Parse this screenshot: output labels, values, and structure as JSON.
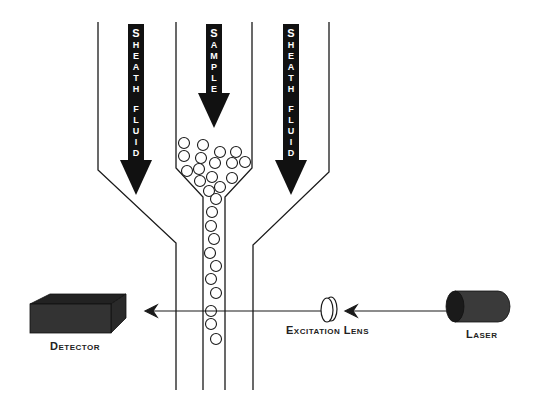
{
  "diagram": {
    "colors": {
      "background": "#ffffff",
      "line": "#1a1a1a",
      "arrow_fill": "#111111",
      "detector_front": "#333333",
      "detector_top": "#222222",
      "detector_side": "#2a2a2a",
      "laser_body": "#3a3a3a",
      "laser_end": "#1a1a1a",
      "arrow_text": "#ffffff"
    },
    "flow_arrows": [
      {
        "id": "sheath-left",
        "letters": [
          "S",
          "H",
          "E",
          "A",
          "T",
          "H",
          "",
          "F",
          "L",
          "U",
          "I",
          "D"
        ],
        "text": "SHEATH FLUID"
      },
      {
        "id": "sample",
        "letters": [
          "S",
          "A",
          "M",
          "P",
          "L",
          "E"
        ],
        "text": "SAMPLE"
      },
      {
        "id": "sheath-right",
        "letters": [
          "S",
          "H",
          "E",
          "A",
          "T",
          "H",
          "",
          "F",
          "L",
          "U",
          "I",
          "D"
        ],
        "text": "SHEATH FLUID"
      }
    ],
    "labels": {
      "detector": "Detector",
      "excitation_lens": "Excitation Lens",
      "laser": "Laser"
    },
    "particles": [
      [
        184,
        143
      ],
      [
        203,
        145
      ],
      [
        220,
        152
      ],
      [
        236,
        152
      ],
      [
        184,
        156
      ],
      [
        201,
        158
      ],
      [
        215,
        163
      ],
      [
        232,
        163
      ],
      [
        245,
        162
      ],
      [
        187,
        171
      ],
      [
        199,
        169
      ],
      [
        212,
        177
      ],
      [
        232,
        178
      ],
      [
        200,
        181
      ],
      [
        220,
        187
      ],
      [
        209,
        191
      ],
      [
        216,
        199
      ],
      [
        212,
        212
      ],
      [
        211,
        226
      ],
      [
        214,
        239
      ],
      [
        210,
        253
      ],
      [
        216,
        266
      ],
      [
        211,
        279
      ],
      [
        216,
        293
      ],
      [
        211,
        311
      ],
      [
        211,
        324
      ],
      [
        216,
        339
      ]
    ]
  }
}
